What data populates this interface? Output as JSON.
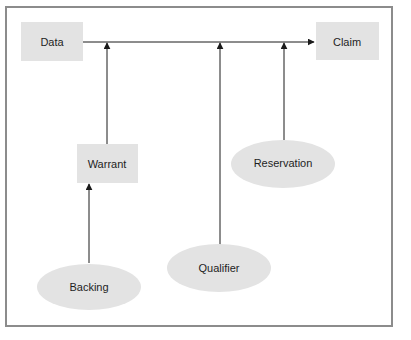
{
  "diagram": {
    "colors": {
      "background": "#ffffff",
      "frame": "#8c8c8c",
      "node_fill": "#e3e3e3",
      "line": "#1a1a1a",
      "text": "#1e1e1e"
    },
    "nodes": [
      {
        "id": "data",
        "label": "Data",
        "shape": "rect"
      },
      {
        "id": "claim",
        "label": "Claim",
        "shape": "rect"
      },
      {
        "id": "warrant",
        "label": "Warrant",
        "shape": "rect"
      },
      {
        "id": "reservation",
        "label": "Reservation",
        "shape": "ellipse"
      },
      {
        "id": "backing",
        "label": "Backing",
        "shape": "ellipse"
      },
      {
        "id": "qualifier",
        "label": "Qualifier",
        "shape": "ellipse"
      }
    ],
    "edges": [
      {
        "from": "data",
        "to": "claim"
      },
      {
        "from": "warrant",
        "to": "data-claim-line"
      },
      {
        "from": "qualifier",
        "to": "data-claim-line"
      },
      {
        "from": "reservation",
        "to": "data-claim-line"
      },
      {
        "from": "backing",
        "to": "warrant"
      }
    ]
  }
}
